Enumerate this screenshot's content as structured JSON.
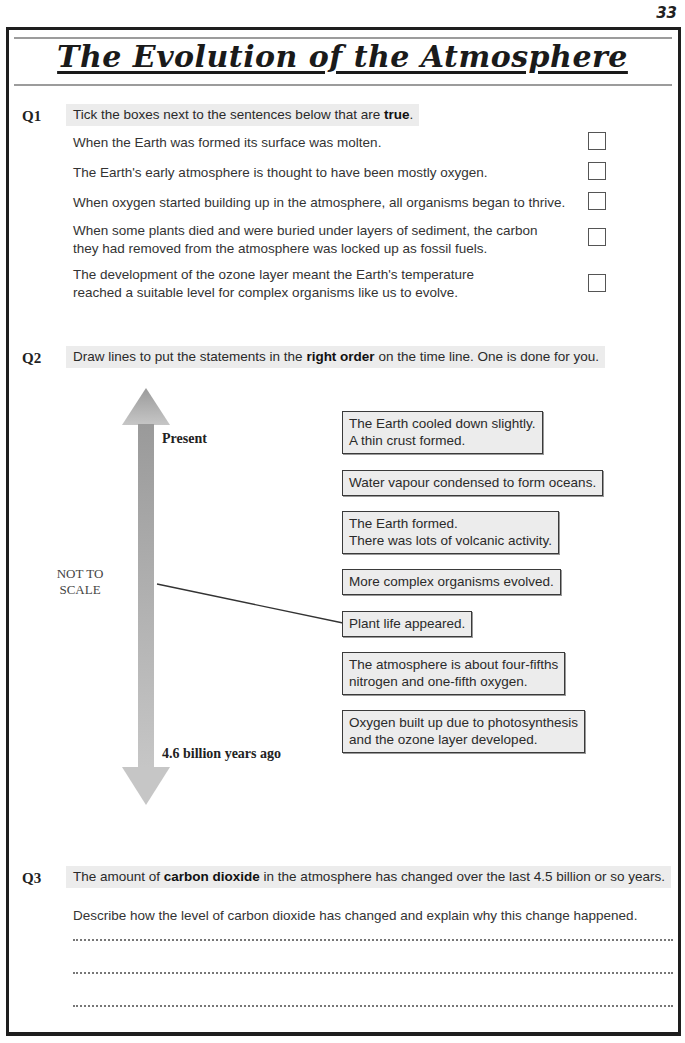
{
  "page": {
    "number": "33",
    "title": "The Evolution of the Atmosphere"
  },
  "q1": {
    "label": "Q1",
    "prompt_before": "Tick the boxes next to the sentences below that are ",
    "prompt_bold": "true",
    "prompt_after": ".",
    "statements": [
      {
        "lines": [
          "When the Earth was formed its surface was molten."
        ],
        "checked": false
      },
      {
        "lines": [
          "The Earth's early atmosphere is thought to have been mostly oxygen."
        ],
        "checked": false
      },
      {
        "lines": [
          "When oxygen started building up in the atmosphere, all organisms began to thrive."
        ],
        "checked": false
      },
      {
        "lines": [
          "When some plants died and were buried under layers of sediment, the carbon",
          "they had removed from the atmosphere was locked up as fossil fuels."
        ],
        "checked": false
      },
      {
        "lines": [
          "The development of the ozone layer meant the Earth's temperature",
          "reached a suitable level for complex organisms like us to evolve."
        ],
        "checked": false
      }
    ]
  },
  "q2": {
    "label": "Q2",
    "prompt_before": "Draw lines to put the statements in the ",
    "prompt_bold": "right order",
    "prompt_after": " on the time line.  One is done for you.",
    "timeline": {
      "top_label": "Present",
      "bottom_label": "4.6 billion years ago",
      "scale_note_line1": "NOT TO",
      "scale_note_line2": "SCALE",
      "arrow_color_top": "#9a9a9a",
      "arrow_color_bottom": "#c6c6c6"
    },
    "cards": [
      {
        "line1": "The Earth cooled down slightly.",
        "line2": "A thin crust formed."
      },
      {
        "line1": "Water vapour condensed to form oceans.",
        "line2": ""
      },
      {
        "line1": "The Earth formed.",
        "line2": "There was lots of volcanic activity."
      },
      {
        "line1": "More complex organisms evolved.",
        "line2": ""
      },
      {
        "line1": "Plant life appeared.",
        "line2": ""
      },
      {
        "line1": "The atmosphere is about four-fifths",
        "line2": "nitrogen and one-fifth oxygen."
      },
      {
        "line1": "Oxygen built up due to photosynthesis",
        "line2": "and the ozone layer developed."
      }
    ],
    "example_connection": {
      "card_index": 4,
      "card_text": "Plant life appeared."
    }
  },
  "q3": {
    "label": "Q3",
    "prompt_before": "The amount of ",
    "prompt_bold": "carbon dioxide",
    "prompt_after": " in the atmosphere has changed over the last 4.5 billion or so years.",
    "instruction": "Describe how the level of carbon dioxide has changed and explain why this change happened.",
    "answer_lines": 3
  }
}
